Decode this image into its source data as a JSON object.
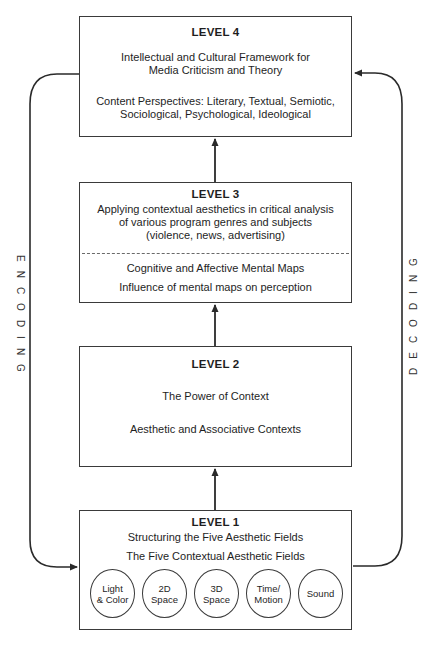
{
  "diagram": {
    "side_labels": {
      "left": "ENCODING",
      "right": "DECODING"
    },
    "levels": [
      {
        "title": "LEVEL 4",
        "lines": [
          "Intellectual and Cultural Framework for",
          "Media Criticism and Theory",
          "Content Perspectives: Literary, Textual, Semiotic,",
          "Sociological, Psychological, Ideological"
        ]
      },
      {
        "title": "LEVEL 3",
        "lines": [
          "Applying contextual aesthetics in critical analysis",
          "of various program genres and subjects",
          "(violence, news, advertising)",
          "Cognitive and Affective Mental Maps",
          "Influence of mental maps on perception"
        ]
      },
      {
        "title": "LEVEL 2",
        "lines": [
          "The Power of Context",
          "Aesthetic and Associative Contexts"
        ]
      },
      {
        "title": "LEVEL 1",
        "lines": [
          "Structuring the Five Aesthetic Fields",
          "The Five Contextual Aesthetic Fields"
        ],
        "fields": [
          {
            "line1": "Light",
            "line2": "& Color"
          },
          {
            "line1": "2D",
            "line2": "Space"
          },
          {
            "line1": "3D",
            "line2": "Space"
          },
          {
            "line1": "Time/",
            "line2": "Motion"
          },
          {
            "line1": "Sound",
            "line2": ""
          }
        ]
      }
    ],
    "colors": {
      "stroke": "#3a3a3a",
      "background": "#ffffff",
      "text": "#1e1e1e"
    }
  }
}
